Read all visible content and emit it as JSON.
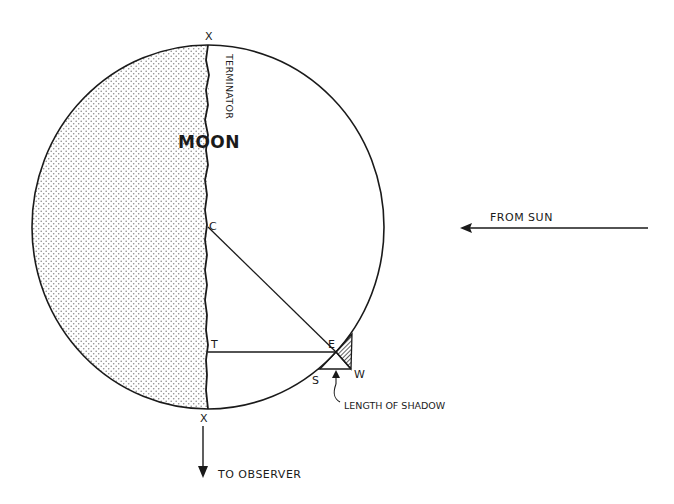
{
  "diagram": {
    "title": "MOON",
    "body_label": "MOON",
    "terminator_label": "TERMINATOR",
    "points": {
      "top_pole": "X",
      "bottom_pole": "X",
      "center": "C",
      "terminator_point": "T",
      "peak": "E",
      "shadow_start": "S",
      "shadow_end": "W"
    },
    "annotations": {
      "from_sun": "FROM SUN",
      "to_observer": "TO OBSERVER",
      "length_of_shadow": "LENGTH OF SHADOW"
    },
    "colors": {
      "ink": "#1a1a1a",
      "background": "#ffffff",
      "dark_side_dots": "#8a8a8a"
    }
  }
}
